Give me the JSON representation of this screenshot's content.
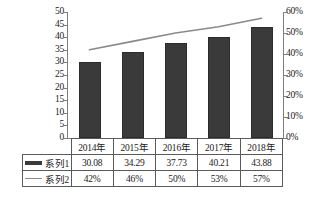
{
  "chart_data": {
    "type": "bar",
    "title": "",
    "subtitle": "",
    "xlabel": "",
    "ylabel": "",
    "grid": false,
    "legend_position": "data-table-below",
    "categories": [
      "2014年",
      "2015年",
      "2016年",
      "2017年",
      "2018年"
    ],
    "series": [
      {
        "name": "系列1",
        "type": "bar",
        "axis": "left",
        "color": "#3a3a3a",
        "values": [
          30.08,
          34.29,
          37.73,
          40.21,
          43.88
        ],
        "value_labels": [
          "30.08",
          "34.29",
          "37.73",
          "40.21",
          "43.88"
        ]
      },
      {
        "name": "系列2",
        "type": "line",
        "axis": "right",
        "color": "#8a8a8a",
        "values": [
          42,
          46,
          50,
          53,
          57
        ],
        "value_labels": [
          "42%",
          "46%",
          "50%",
          "53%",
          "57%"
        ]
      }
    ],
    "axes": {
      "left": {
        "min": 0,
        "max": 50,
        "step": 5,
        "ticks": [
          "0",
          "5",
          "10",
          "15",
          "20",
          "25",
          "30",
          "35",
          "40",
          "45",
          "50"
        ]
      },
      "right": {
        "min": 0,
        "max": 60,
        "step": 10,
        "ticks": [
          "0%",
          "10%",
          "20%",
          "30%",
          "40%",
          "50%",
          "60%"
        ]
      }
    }
  },
  "table": {
    "header": [
      "2014年",
      "2015年",
      "2016年",
      "2017年",
      "2018年"
    ],
    "rows": [
      {
        "legend": "系列1",
        "marker": "bar-swatch-icon",
        "cells": [
          "30.08",
          "34.29",
          "37.73",
          "40.21",
          "43.88"
        ]
      },
      {
        "legend": "系列2",
        "marker": "line-swatch-icon",
        "cells": [
          "42%",
          "46%",
          "50%",
          "53%",
          "57%"
        ]
      }
    ]
  }
}
